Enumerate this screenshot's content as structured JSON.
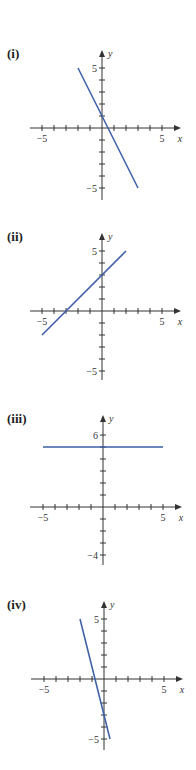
{
  "line_color": "#3d5fa8",
  "axis_color": "#333333",
  "chart_data": [
    {
      "id": "i",
      "type": "line",
      "label": "(i)",
      "title": "",
      "xlabel": "x",
      "ylabel": "y",
      "x_tick_labels": [
        "-5",
        "5"
      ],
      "y_tick_labels": [
        "5",
        "-5"
      ],
      "y_tick_label_values": [
        5,
        -5
      ],
      "xlim": [
        -5,
        5
      ],
      "ylim": [
        -5,
        5
      ],
      "grid": false,
      "series": [
        {
          "name": "line",
          "x": [
            -2,
            3
          ],
          "y": [
            5,
            -5
          ],
          "equation": "y = -2x + 1"
        }
      ],
      "layout": {
        "top": 0,
        "origin": [
          102,
          128
        ],
        "unit": 12,
        "y_axis_top": 50,
        "y_axis_bottom": 200,
        "x_axis_left": 30,
        "x_axis_right": 181,
        "label_y": 52,
        "y_ticks": [
          -5,
          5
        ]
      }
    },
    {
      "id": "ii",
      "type": "line",
      "label": "(ii)",
      "title": "",
      "xlabel": "x",
      "ylabel": "y",
      "x_tick_labels": [
        "-5",
        "5"
      ],
      "y_tick_labels": [
        "5",
        "-5"
      ],
      "y_tick_label_values": [
        5,
        -5
      ],
      "xlim": [
        -5,
        5
      ],
      "ylim": [
        -5,
        5
      ],
      "grid": false,
      "series": [
        {
          "name": "line",
          "x": [
            -5,
            2
          ],
          "y": [
            -2,
            5
          ],
          "equation": "y = x + 3"
        }
      ],
      "layout": {
        "top": 0,
        "origin": [
          102,
          311
        ],
        "unit": 12,
        "y_axis_top": 233,
        "y_axis_bottom": 380,
        "x_axis_left": 30,
        "x_axis_right": 181,
        "label_y": 235,
        "y_ticks": [
          -5,
          5
        ]
      }
    },
    {
      "id": "iii",
      "type": "line",
      "label": "(iii)",
      "title": "",
      "xlabel": "x",
      "ylabel": "y",
      "x_tick_labels": [
        "-5",
        "5"
      ],
      "y_tick_labels": [
        "6",
        "-4"
      ],
      "y_tick_label_values": [
        6,
        -4
      ],
      "xlim": [
        -5,
        5
      ],
      "ylim": [
        -4,
        6
      ],
      "grid": false,
      "series": [
        {
          "name": "line",
          "x": [
            -5,
            5
          ],
          "y": [
            5,
            5
          ],
          "equation": "y = 5"
        }
      ],
      "layout": {
        "top": 0,
        "origin": [
          103,
          507
        ],
        "unit": 12,
        "y_axis_top": 415,
        "y_axis_bottom": 565,
        "x_axis_left": 30,
        "x_axis_right": 182,
        "label_y": 417,
        "y_ticks": [
          -4,
          6
        ]
      }
    },
    {
      "id": "iv",
      "type": "line",
      "label": "(iv)",
      "title": "",
      "xlabel": "x",
      "ylabel": "y",
      "x_tick_labels": [
        "-5",
        "5"
      ],
      "y_tick_labels": [
        "5",
        "-5"
      ],
      "y_tick_label_values": [
        5,
        -5
      ],
      "xlim": [
        -5,
        5
      ],
      "ylim": [
        -5,
        5
      ],
      "grid": false,
      "series": [
        {
          "name": "line",
          "x": [
            -2,
            0.5
          ],
          "y": [
            5,
            -5
          ],
          "equation": "y = -4x - 3"
        }
      ],
      "layout": {
        "top": 0,
        "origin": [
          104,
          679
        ],
        "unit": 12,
        "y_axis_top": 601,
        "y_axis_bottom": 750,
        "x_axis_left": 31,
        "x_axis_right": 183,
        "label_y": 603,
        "y_ticks": [
          -5,
          5
        ]
      }
    }
  ]
}
